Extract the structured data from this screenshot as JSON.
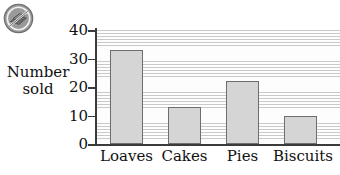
{
  "badge": {
    "icon": "no-copy-prohibition-icon",
    "color": "#8c8c8c"
  },
  "chart_data": {
    "type": "bar",
    "title": "",
    "xlabel": "",
    "ylabel": "Number sold",
    "ylabel_lines": [
      "Number",
      "sold"
    ],
    "categories": [
      "Loaves",
      "Cakes",
      "Pies",
      "Biscuits"
    ],
    "values": [
      33,
      13,
      22,
      10
    ],
    "ylim": [
      0,
      40
    ],
    "yticks": [
      0,
      10,
      20,
      30,
      40
    ],
    "ytick_labels": [
      "0",
      "10",
      "20",
      "30",
      "40"
    ],
    "grid": "horizontal-hatch",
    "legend": "none",
    "bar_fill": "#d5d5d5",
    "bar_edge": "#6e6e6e"
  }
}
